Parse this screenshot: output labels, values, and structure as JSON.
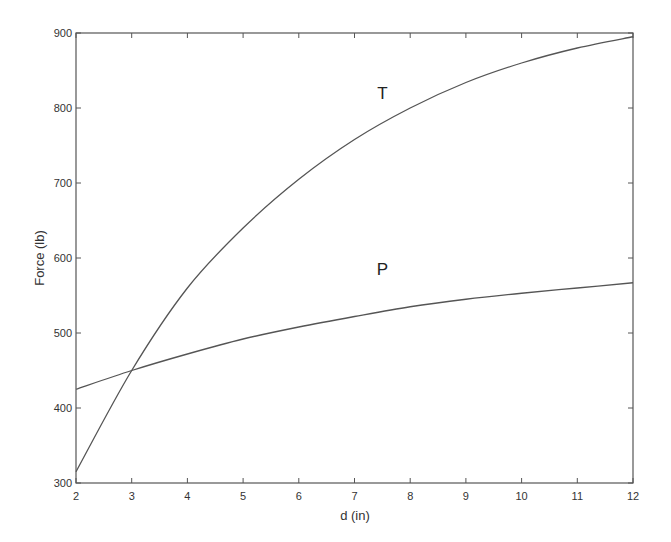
{
  "chart_data": {
    "type": "line",
    "title": "",
    "xlabel": "d (in)",
    "ylabel": "Force (lb)",
    "xlim": [
      2,
      12
    ],
    "ylim": [
      300,
      900
    ],
    "xticks": [
      2,
      3,
      4,
      5,
      6,
      7,
      8,
      9,
      10,
      11,
      12
    ],
    "yticks": [
      300,
      400,
      500,
      600,
      700,
      800,
      900
    ],
    "grid": false,
    "legend": "none (curves labeled inline)",
    "x": [
      2,
      3,
      4,
      5,
      6,
      7,
      8,
      9,
      10,
      11,
      12
    ],
    "series": [
      {
        "name": "T",
        "values": [
          315,
          450,
          560,
          640,
          705,
          758,
          800,
          834,
          860,
          880,
          895
        ],
        "label_pos": [
          7.5,
          820
        ]
      },
      {
        "name": "P",
        "values": [
          425,
          450,
          472,
          492,
          508,
          522,
          535,
          545,
          553,
          560,
          567
        ],
        "label_pos": [
          7.5,
          585
        ]
      }
    ],
    "line_color": "#555555"
  }
}
